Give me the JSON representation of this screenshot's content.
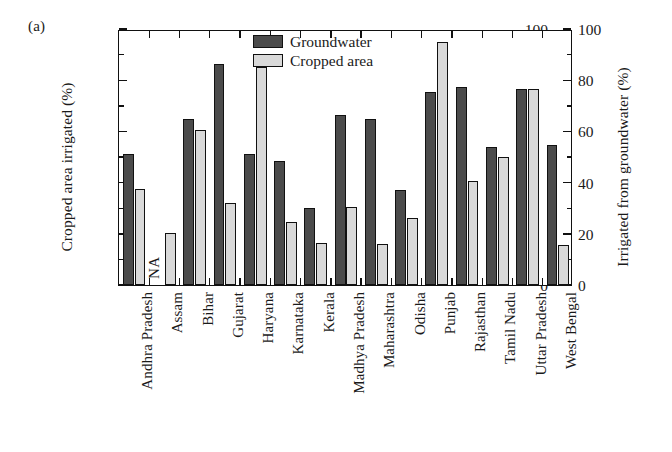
{
  "figure": {
    "panel_label": "(a)"
  },
  "legend": {
    "position": "top-center",
    "items": [
      {
        "label": "Groundwater",
        "color": "#4b4b4b"
      },
      {
        "label": "Cropped area",
        "color": "#d9d9d9"
      }
    ]
  },
  "axes": {
    "left_title": "Cropped area irrigated (%)",
    "right_title": "Irrigated from groundwater (%)",
    "tick_labels": [
      "0",
      "20",
      "40",
      "60",
      "80",
      "100"
    ],
    "tick_values": [
      0,
      20,
      40,
      60,
      80,
      100
    ]
  },
  "annotations": {
    "assam_na": "NA"
  },
  "chart_data": {
    "type": "bar",
    "title": "",
    "xlabel": "",
    "ylabel": "Cropped area irrigated (%)",
    "y2label": "Irrigated from groundwater (%)",
    "ylim": [
      0,
      100
    ],
    "y2lim": [
      0,
      100
    ],
    "yticks": [
      0,
      20,
      40,
      60,
      80,
      100
    ],
    "grid": false,
    "legend_position": "top-center",
    "categories": [
      "Andhra Pradesh",
      "Assam",
      "Bihar",
      "Gujarat",
      "Haryana",
      "Karnataka",
      "Kerala",
      "Madhya Pradesh",
      "Maharashtra",
      "Odisha",
      "Punjab",
      "Rajasthan",
      "Tamil Nadu",
      "Uttar Pradesh",
      "West Bengal"
    ],
    "series": [
      {
        "name": "Groundwater",
        "color": "#4b4b4b",
        "values": [
          51,
          null,
          65,
          86.5,
          51,
          48.5,
          30,
          66.5,
          65,
          37,
          75.5,
          77.5,
          54,
          76.5,
          54.5
        ]
      },
      {
        "name": "Cropped area",
        "color": "#d9d9d9",
        "values": [
          37.5,
          20.5,
          60.5,
          32,
          85,
          24.5,
          16.5,
          30.5,
          16,
          26,
          95,
          40.5,
          50,
          76.5,
          15.5
        ]
      }
    ],
    "notes": [
      {
        "category": "Assam",
        "series": "Groundwater",
        "text": "NA"
      }
    ]
  }
}
